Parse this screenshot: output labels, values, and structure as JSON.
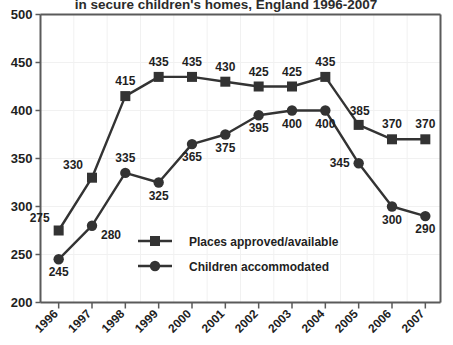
{
  "chart_data": {
    "type": "line",
    "title": "in secure children's homes, England 1996-2007",
    "xlabel": "",
    "ylabel": "",
    "ylim": [
      200,
      500
    ],
    "ytick_step": 50,
    "yticks": [
      "200",
      "250",
      "300",
      "350",
      "400",
      "450",
      "500"
    ],
    "grid": true,
    "legend_position": "inside-bottom-center",
    "categories": [
      "1996",
      "1997",
      "1998",
      "1999",
      "2000",
      "2001",
      "2002",
      "2003",
      "2004",
      "2005",
      "2006",
      "2007"
    ],
    "series": [
      {
        "name": "Places approved/available",
        "marker": "square",
        "color": "#333333",
        "values": [
          275,
          330,
          415,
          435,
          435,
          430,
          425,
          425,
          435,
          385,
          370,
          370
        ],
        "label_positions": [
          "above-left",
          "above-left",
          "above",
          "above",
          "above",
          "above",
          "above",
          "above",
          "above",
          "above-right",
          "above",
          "above"
        ]
      },
      {
        "name": "Children accommodated",
        "marker": "circle",
        "color": "#333333",
        "values": [
          245,
          280,
          335,
          325,
          365,
          375,
          395,
          400,
          400,
          345,
          300,
          290
        ],
        "label_positions": [
          "below",
          "below-right",
          "above",
          "below",
          "below",
          "below",
          "below",
          "below",
          "below",
          "left",
          "below",
          "below"
        ]
      }
    ]
  },
  "colors": {
    "background": "#ffffff",
    "axis": "#5a5a5a",
    "gridline": "#f1f1f1",
    "series": "#333333",
    "text": "#1f1f1f"
  }
}
